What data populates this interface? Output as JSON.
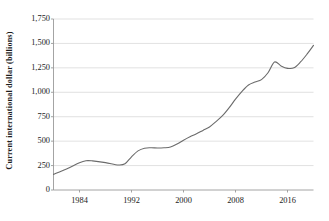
{
  "chart_data": {
    "type": "line",
    "title": "",
    "subtitle": "",
    "xlabel": "",
    "ylabel": "Current international dollar (billions)",
    "xlim": [
      1980,
      2020
    ],
    "ylim": [
      0,
      1750
    ],
    "grid": "horizontal",
    "legend": "none",
    "line_color": "#6b6b6b",
    "gridline_color": "#d9d9d9",
    "axis_color": "#9a9a9a",
    "text_color": "#1c1c1c",
    "background_color": "#ffffff",
    "y_ticks": [
      0,
      250,
      500,
      750,
      1000,
      1250,
      1500,
      1750
    ],
    "y_tick_labels": [
      "0",
      "250",
      "500",
      "750",
      "1,000",
      "1,250",
      "1,500",
      "1,750"
    ],
    "x_ticks": [
      1984,
      1992,
      2000,
      2008,
      2016
    ],
    "x_tick_labels": [
      "1984",
      "1992",
      "2000",
      "2008",
      "2016"
    ],
    "x": [
      1980,
      1981,
      1982,
      1983,
      1984,
      1985,
      1986,
      1987,
      1988,
      1989,
      1990,
      1991,
      1992,
      1993,
      1994,
      1995,
      1996,
      1997,
      1998,
      1999,
      2000,
      2001,
      2002,
      2003,
      2004,
      2005,
      2006,
      2007,
      2008,
      2009,
      2010,
      2011,
      2012,
      2013,
      2014,
      2015,
      2016,
      2017,
      2018,
      2019,
      2020
    ],
    "values": [
      160,
      185,
      212,
      238,
      268,
      295,
      302,
      295,
      283,
      268,
      256,
      262,
      300,
      350,
      400,
      428,
      432,
      432,
      430,
      440,
      465,
      495,
      520,
      548,
      578,
      608,
      640,
      678,
      722,
      772,
      830,
      890,
      950,
      1010,
      1080,
      1118,
      1125,
      1155,
      1215,
      1282,
      1310
    ],
    "values_tail_note": "",
    "series": [
      {
        "name": "Current international dollar (billions)",
        "x": [
          1980,
          1982,
          1984,
          1985,
          1986,
          1988,
          1990,
          1991,
          1992,
          1993,
          1994,
          1995,
          1996,
          1997,
          1998,
          1999,
          2000,
          2001,
          2002,
          2003,
          2004,
          2005,
          2006,
          2007,
          2008,
          2009,
          2010,
          2011,
          2012,
          2013,
          2014,
          2015,
          2016,
          2017,
          2018,
          2019,
          2020
        ],
        "values": [
          160,
          215,
          280,
          300,
          298,
          280,
          256,
          268,
          340,
          400,
          428,
          432,
          430,
          432,
          440,
          470,
          510,
          545,
          575,
          610,
          645,
          700,
          760,
          840,
          930,
          1010,
          1075,
          1105,
          1130,
          1200,
          1310,
          1270,
          1245,
          1250,
          1310,
          1390,
          1480
        ]
      }
    ],
    "annotations": []
  }
}
